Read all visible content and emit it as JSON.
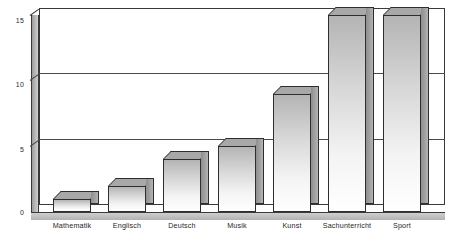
{
  "chart_data": {
    "type": "bar",
    "title": "",
    "subtitle": "",
    "xlabel": "",
    "ylabel": "",
    "categories": [
      "Mathematik",
      "Englisch",
      "Deutsch",
      "Musik",
      "Kunst",
      "Sachunterricht",
      "Sport"
    ],
    "values": [
      1,
      2,
      4,
      5,
      9,
      15,
      15
    ],
    "ylim": [
      0,
      15
    ],
    "yticks": [
      "0",
      "5",
      "10",
      "15"
    ],
    "ytick_values": [
      0,
      5,
      10,
      15
    ],
    "grid": true,
    "legend": "none",
    "style": "3d-column",
    "colors": {
      "bar_face_top": "#b4b4b4",
      "bar_face_bottom": "#ffffff",
      "bar_side": "#a3a3a3",
      "bar_top": "#a8a8a8",
      "outline": "#2e2e2e",
      "gridline": "#4a4a4a",
      "axis_wall": "#b8b8b8",
      "background": "#ffffff",
      "text": "#1f1f1f"
    }
  },
  "axes": {
    "y": {
      "ticks": [
        {
          "label": "15",
          "value": 15
        },
        {
          "label": "10",
          "value": 10
        },
        {
          "label": "5",
          "value": 5
        },
        {
          "label": "0",
          "value": 0
        }
      ]
    },
    "x": {
      "ticks": [
        {
          "label": "Mathematik"
        },
        {
          "label": "Englisch"
        },
        {
          "label": "Deutsch"
        },
        {
          "label": "Musik"
        },
        {
          "label": "Kunst"
        },
        {
          "label": "Sachunterricht"
        },
        {
          "label": "Sport"
        }
      ]
    }
  }
}
